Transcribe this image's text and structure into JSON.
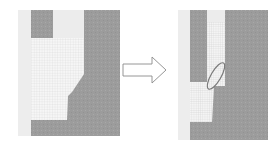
{
  "figure": {
    "colors": {
      "background": "#ffffff",
      "light_strip": "#ededed",
      "solid_dark": "#9a9a9a",
      "light_block": "#ececec",
      "mesh_bg": "#f6f6f6",
      "mesh_line": "#c8c8c8",
      "arrow_stroke": "#8a8a8a",
      "ellipse_stroke": "#7a7a7a"
    },
    "panels": [
      {
        "name": "before",
        "label": ""
      },
      {
        "name": "after",
        "label": ""
      }
    ],
    "arrow": {
      "direction": "right"
    }
  }
}
